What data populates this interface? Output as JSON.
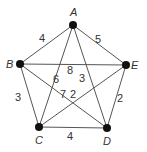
{
  "graph": {
    "vertices": [
      {
        "id": "A",
        "x": 73,
        "y": 25,
        "lx": 70,
        "ly": 16
      },
      {
        "id": "B",
        "x": 20,
        "y": 64,
        "lx": 6,
        "ly": 68
      },
      {
        "id": "E",
        "x": 126,
        "y": 65,
        "lx": 131,
        "ly": 69
      },
      {
        "id": "C",
        "x": 39,
        "y": 127,
        "lx": 35,
        "ly": 144
      },
      {
        "id": "D",
        "x": 107,
        "y": 128,
        "lx": 103,
        "ly": 145
      }
    ],
    "edges": [
      {
        "from": "A",
        "to": "B",
        "weight": "4",
        "lx": 42,
        "ly": 42
      },
      {
        "from": "A",
        "to": "E",
        "weight": "5",
        "lx": 98,
        "ly": 43
      },
      {
        "from": "B",
        "to": "E",
        "weight": "8",
        "lx": 70,
        "ly": 74
      },
      {
        "from": "A",
        "to": "C",
        "weight": "6",
        "lx": 56,
        "ly": 83
      },
      {
        "from": "A",
        "to": "D",
        "weight": "3",
        "lx": 82,
        "ly": 82
      },
      {
        "from": "B",
        "to": "D",
        "weight": "7",
        "lx": 63,
        "ly": 98
      },
      {
        "from": "C",
        "to": "E",
        "weight": "2",
        "lx": 73,
        "ly": 98
      },
      {
        "from": "B",
        "to": "C",
        "weight": "3",
        "lx": 18,
        "ly": 101
      },
      {
        "from": "E",
        "to": "D",
        "weight": "2",
        "lx": 120,
        "ly": 102
      },
      {
        "from": "C",
        "to": "D",
        "weight": "4",
        "lx": 70,
        "ly": 140
      }
    ]
  }
}
